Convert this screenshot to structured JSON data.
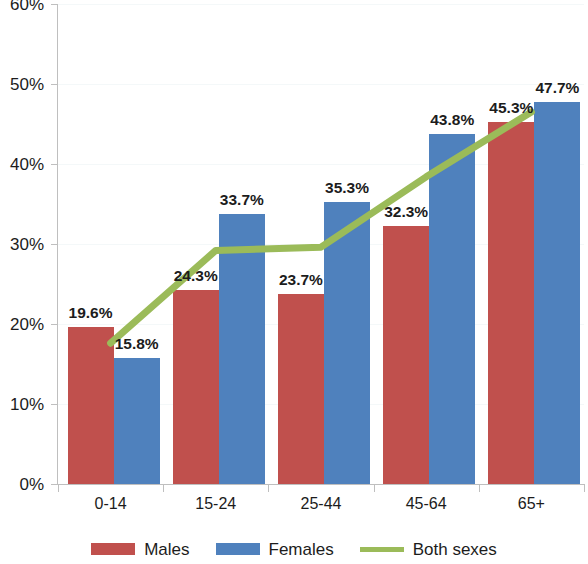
{
  "chart_data": {
    "type": "bar",
    "title": "",
    "subtitle": "",
    "xlabel": "",
    "ylabel": "",
    "categories": [
      "0-14",
      "15-24",
      "25-44",
      "45-64",
      "65+"
    ],
    "ylim": [
      0,
      60
    ],
    "y_ticks": [
      0,
      10,
      20,
      30,
      40,
      50,
      60
    ],
    "y_tick_labels": [
      "0%",
      "10%",
      "20%",
      "30%",
      "40%",
      "50%",
      "60%"
    ],
    "grid": true,
    "legend_position": "bottom",
    "value_suffix": "%",
    "series": [
      {
        "name": "Males",
        "type": "bar",
        "color": "#c0504d",
        "values": [
          19.6,
          24.3,
          23.7,
          32.3,
          45.3
        ],
        "labels": [
          "19.6%",
          "24.3%",
          "23.7%",
          "32.3%",
          "45.3%"
        ]
      },
      {
        "name": "Females",
        "type": "bar",
        "color": "#4f81bd",
        "values": [
          15.8,
          33.7,
          35.3,
          43.8,
          47.7
        ],
        "labels": [
          "15.8%",
          "33.7%",
          "35.3%",
          "43.8%",
          "47.7%"
        ]
      },
      {
        "name": "Both sexes",
        "type": "line",
        "color": "#9bbb59",
        "values": [
          17.6,
          29.2,
          29.6,
          38.4,
          46.5
        ],
        "labels": []
      }
    ]
  },
  "legend": {
    "items": [
      {
        "label": "Males",
        "color": "#c0504d",
        "marker": "square"
      },
      {
        "label": "Females",
        "color": "#4f81bd",
        "marker": "square"
      },
      {
        "label": "Both sexes",
        "color": "#9bbb59",
        "marker": "line"
      }
    ]
  },
  "axes": {
    "y_tick_labels": [
      "60%",
      "50%",
      "40%",
      "30%",
      "20%",
      "10%",
      "0%"
    ],
    "x_tick_labels": [
      "0-14",
      "15-24",
      "25-44",
      "45-64",
      "65+"
    ]
  }
}
